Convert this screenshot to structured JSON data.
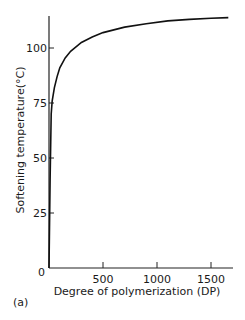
{
  "chart_data": {
    "type": "line",
    "title": "",
    "panel_label": "(a)",
    "xlabel": "Degree of polymerization (DP)",
    "ylabel": "Softening temperature(°C)",
    "xlim": [
      0,
      1700
    ],
    "ylim": [
      0,
      118
    ],
    "x_ticks": [
      0,
      500,
      1000,
      1500
    ],
    "x_tick_labels": [
      "500",
      "1000",
      "1500"
    ],
    "y_ticks": [
      0,
      25,
      50,
      75,
      100
    ],
    "y_tick_labels": [
      "0",
      "25",
      "50",
      "75",
      "100"
    ],
    "grid": false,
    "legend": null,
    "series": [
      {
        "name": "Softening temperature",
        "x": [
          0,
          10,
          20,
          30,
          50,
          75,
          100,
          150,
          200,
          300,
          400,
          500,
          700,
          900,
          1100,
          1300,
          1500,
          1660
        ],
        "y": [
          0,
          40,
          70,
          76,
          82,
          87,
          91,
          95.5,
          98.5,
          102.5,
          105,
          107,
          109.5,
          111,
          112.3,
          113,
          113.5,
          113.8
        ]
      }
    ]
  }
}
